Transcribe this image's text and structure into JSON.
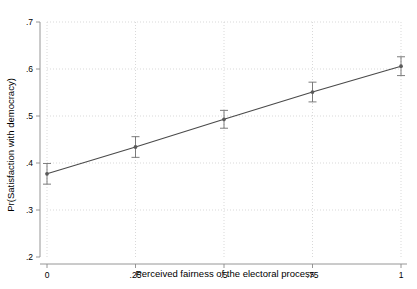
{
  "chart_data": {
    "type": "line",
    "title": "",
    "subtitle": "",
    "xlabel": "Perceived fairness of the electoral process",
    "ylabel": "Pr(Satisfaction with democracy)",
    "xlim": [
      0,
      1
    ],
    "ylim": [
      0.2,
      0.7
    ],
    "xticks": [
      0,
      0.25,
      0.5,
      0.75,
      1
    ],
    "xticklabels": [
      "0",
      ".25",
      ".5",
      ".75",
      "1"
    ],
    "yticks": [
      0.2,
      0.3,
      0.4,
      0.5,
      0.6,
      0.7
    ],
    "yticklabels": [
      ".2",
      ".3",
      ".4",
      ".5",
      ".6",
      ".7"
    ],
    "grid": true,
    "grid_style": "dotted",
    "legend": null,
    "legend_position": "none",
    "annotations": [],
    "x": [
      0,
      0.25,
      0.5,
      0.75,
      1
    ],
    "values": [
      0.377,
      0.434,
      0.493,
      0.551,
      0.606
    ],
    "error_low": [
      0.355,
      0.412,
      0.474,
      0.53,
      0.586
    ],
    "error_high": [
      0.399,
      0.456,
      0.512,
      0.572,
      0.626
    ],
    "series": [
      {
        "name": "Predicted probability",
        "x": [
          0,
          0.25,
          0.5,
          0.75,
          1
        ],
        "values": [
          0.377,
          0.434,
          0.493,
          0.551,
          0.606
        ],
        "error_low": [
          0.355,
          0.412,
          0.474,
          0.53,
          0.586
        ],
        "error_high": [
          0.399,
          0.456,
          0.512,
          0.572,
          0.626
        ]
      }
    ]
  },
  "colors": {
    "line": "#4a4a4a",
    "marker": "#5a5a5a",
    "error": "#6e6e6e",
    "grid": "#c8c8c8",
    "axis": "#8a8a8a",
    "background": "#ffffff",
    "text": "#000000"
  }
}
